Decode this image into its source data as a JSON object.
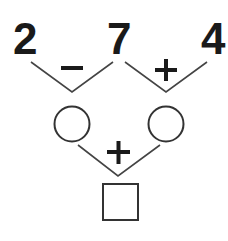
{
  "numbers": {
    "a": "2",
    "b": "7",
    "c": "4"
  },
  "operators": {
    "left": "−",
    "right": "+",
    "bottom": "+"
  },
  "blanks": {
    "left_circle": "",
    "right_circle": "",
    "result_square": ""
  },
  "colors": {
    "ink": "#1a1a1a",
    "line": "#444444",
    "background": "#ffffff"
  }
}
